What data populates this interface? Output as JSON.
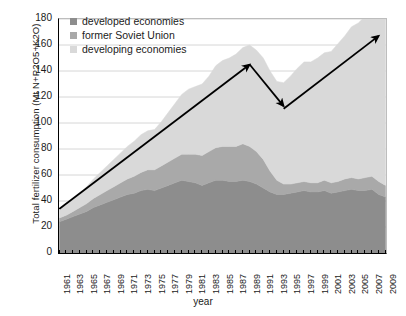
{
  "chart_data": {
    "type": "area",
    "title": "",
    "xlabel": "year",
    "ylabel": "Total fertilizer consumption (Mt N+P2O5+K2O)",
    "ylim": [
      0,
      180
    ],
    "yticks": [
      0,
      20,
      40,
      60,
      80,
      100,
      120,
      140,
      160,
      180
    ],
    "xlim": [
      1961,
      2009
    ],
    "grid": true,
    "legend_position": "top-left",
    "stacked": true,
    "x": [
      1961,
      1962,
      1963,
      1964,
      1965,
      1966,
      1967,
      1968,
      1969,
      1970,
      1971,
      1972,
      1973,
      1974,
      1975,
      1976,
      1977,
      1978,
      1979,
      1980,
      1981,
      1982,
      1983,
      1984,
      1985,
      1986,
      1987,
      1988,
      1989,
      1990,
      1991,
      1992,
      1993,
      1994,
      1995,
      1996,
      1997,
      1998,
      1999,
      2000,
      2001,
      2002,
      2003,
      2004,
      2005,
      2006,
      2007,
      2008,
      2009
    ],
    "xtick_labels": [
      "1961",
      "1963",
      "1965",
      "1967",
      "1969",
      "1971",
      "1973",
      "1975",
      "1977",
      "1979",
      "1981",
      "1983",
      "1985",
      "1987",
      "1989",
      "1991",
      "1993",
      "1995",
      "1997",
      "1999",
      "2001",
      "2003",
      "2005",
      "2007",
      "2009"
    ],
    "series": [
      {
        "name": "developed economies",
        "color": "#8d8d8d",
        "values": [
          24,
          26,
          28,
          30,
          32,
          35,
          37,
          39,
          41,
          43,
          45,
          46,
          48,
          49,
          48,
          50,
          52,
          54,
          56,
          55,
          54,
          52,
          54,
          56,
          56,
          55,
          55,
          56,
          55,
          53,
          50,
          47,
          45,
          45,
          46,
          47,
          48,
          47,
          47,
          48,
          46,
          47,
          48,
          49,
          48,
          48,
          49,
          45,
          43
        ]
      },
      {
        "name": "former Soviet Union",
        "color": "#a9a9a9",
        "values": [
          3,
          3,
          4,
          5,
          6,
          7,
          8,
          9,
          10,
          11,
          12,
          13,
          14,
          15,
          16,
          17,
          18,
          19,
          20,
          21,
          22,
          23,
          24,
          25,
          26,
          27,
          27,
          28,
          27,
          25,
          22,
          16,
          11,
          8,
          7,
          7,
          7,
          7,
          7,
          8,
          8,
          8,
          9,
          9,
          9,
          10,
          10,
          10,
          9
        ]
      },
      {
        "name": "developing economies",
        "color": "#d9d9d9",
        "values": [
          7,
          8,
          9,
          11,
          13,
          15,
          17,
          19,
          21,
          23,
          25,
          27,
          29,
          30,
          31,
          34,
          38,
          42,
          46,
          50,
          52,
          55,
          58,
          63,
          66,
          68,
          71,
          74,
          78,
          78,
          78,
          77,
          76,
          78,
          83,
          88,
          92,
          93,
          96,
          98,
          101,
          106,
          110,
          116,
          120,
          124,
          130,
          128,
          131
        ]
      }
    ],
    "annotations": [
      {
        "name": "rise-arrow-1",
        "type": "arrow",
        "from": {
          "x": 1961,
          "y": 34
        },
        "to": {
          "x": 1989,
          "y": 145
        }
      },
      {
        "name": "decline-arrow",
        "type": "arrow",
        "from": {
          "x": 1989,
          "y": 145
        },
        "to": {
          "x": 1994,
          "y": 113
        }
      },
      {
        "name": "rise-arrow-2",
        "type": "arrow",
        "from": {
          "x": 1994,
          "y": 111
        },
        "to": {
          "x": 2008,
          "y": 167
        }
      }
    ]
  },
  "legend": {
    "items": [
      {
        "label": "developed economies",
        "color": "#8d8d8d"
      },
      {
        "label": "former Soviet Union",
        "color": "#a9a9a9"
      },
      {
        "label": "developing economies",
        "color": "#d9d9d9"
      }
    ]
  }
}
